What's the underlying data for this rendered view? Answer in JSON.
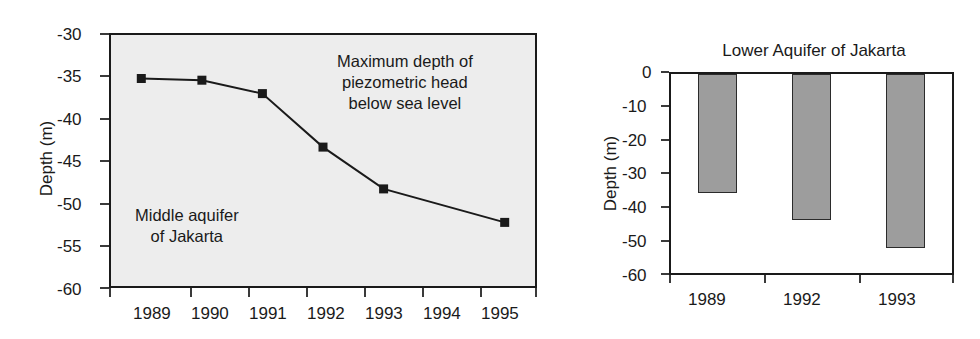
{
  "figure": {
    "background": "#ffffff",
    "ink_color": "#1a1a1a"
  },
  "chart_data": [
    {
      "type": "line",
      "title": "",
      "panel": "left",
      "plot_background": "#ededed",
      "xlabel": "",
      "ylabel": "Depth (m)",
      "categories": [
        "1989",
        "1990",
        "1991",
        "1992",
        "1993",
        "1994",
        "1995"
      ],
      "xtick_labels": [
        "1989",
        "1990",
        "1991",
        "1992",
        "1993",
        "1994",
        "1995"
      ],
      "ytick_labels": [
        "-30",
        "-35",
        "-40",
        "-45",
        "-50",
        "-55",
        "-60"
      ],
      "ylim": [
        -60,
        -30
      ],
      "grid": false,
      "legend": "none",
      "marker": "filled-square",
      "series": [
        {
          "name": "Maximum depth of piezometric head below sea level",
          "x": [
            "1989",
            "1990",
            "1991",
            "1992",
            "1993",
            "1995"
          ],
          "values": [
            -35.2,
            -35.4,
            -37.0,
            -43.4,
            -48.4,
            -52.4
          ]
        }
      ],
      "annotations": [
        {
          "id": "max-depth-note",
          "text_lines": [
            "Maximum depth of",
            "piezometric head",
            "below sea level"
          ]
        },
        {
          "id": "aquifer-note",
          "text_lines": [
            "Middle aquifer",
            "of Jakarta"
          ]
        }
      ]
    },
    {
      "type": "bar",
      "title": "Lower Aquifer of Jakarta",
      "panel": "right",
      "plot_background": "#ffffff",
      "bar_fill": "#9d9d9d",
      "bar_stroke": "#2b2b2b",
      "xlabel": "",
      "ylabel": "Depth (m)",
      "categories": [
        "1989",
        "1992",
        "1993"
      ],
      "xtick_labels": [
        "1989",
        "1992",
        "1993"
      ],
      "ytick_labels": [
        "0",
        "-10",
        "-20",
        "-30",
        "-40",
        "-50",
        "-60"
      ],
      "ylim": [
        -60,
        0
      ],
      "grid": false,
      "legend": "none",
      "values": [
        -36.0,
        -44.0,
        -52.5
      ]
    }
  ],
  "left_chart": {
    "ylabel": "Depth (m)",
    "ytick_labels": [
      "-30",
      "-35",
      "-40",
      "-45",
      "-50",
      "-55",
      "-60"
    ],
    "xtick_labels": [
      "1989",
      "1990",
      "1991",
      "1992",
      "1993",
      "1994",
      "1995"
    ],
    "annotation_max_depth": {
      "line1": "Maximum depth of",
      "line2": "piezometric head",
      "line3": "below sea level"
    },
    "annotation_aquifer": {
      "line1": "Middle aquifer",
      "line2": "of Jakarta"
    }
  },
  "right_chart": {
    "title": "Lower Aquifer of Jakarta",
    "ylabel": "Depth (m)",
    "ytick_labels": [
      "0",
      "-10",
      "-20",
      "-30",
      "-40",
      "-50",
      "-60"
    ],
    "xtick_labels": [
      "1989",
      "1992",
      "1993"
    ]
  }
}
